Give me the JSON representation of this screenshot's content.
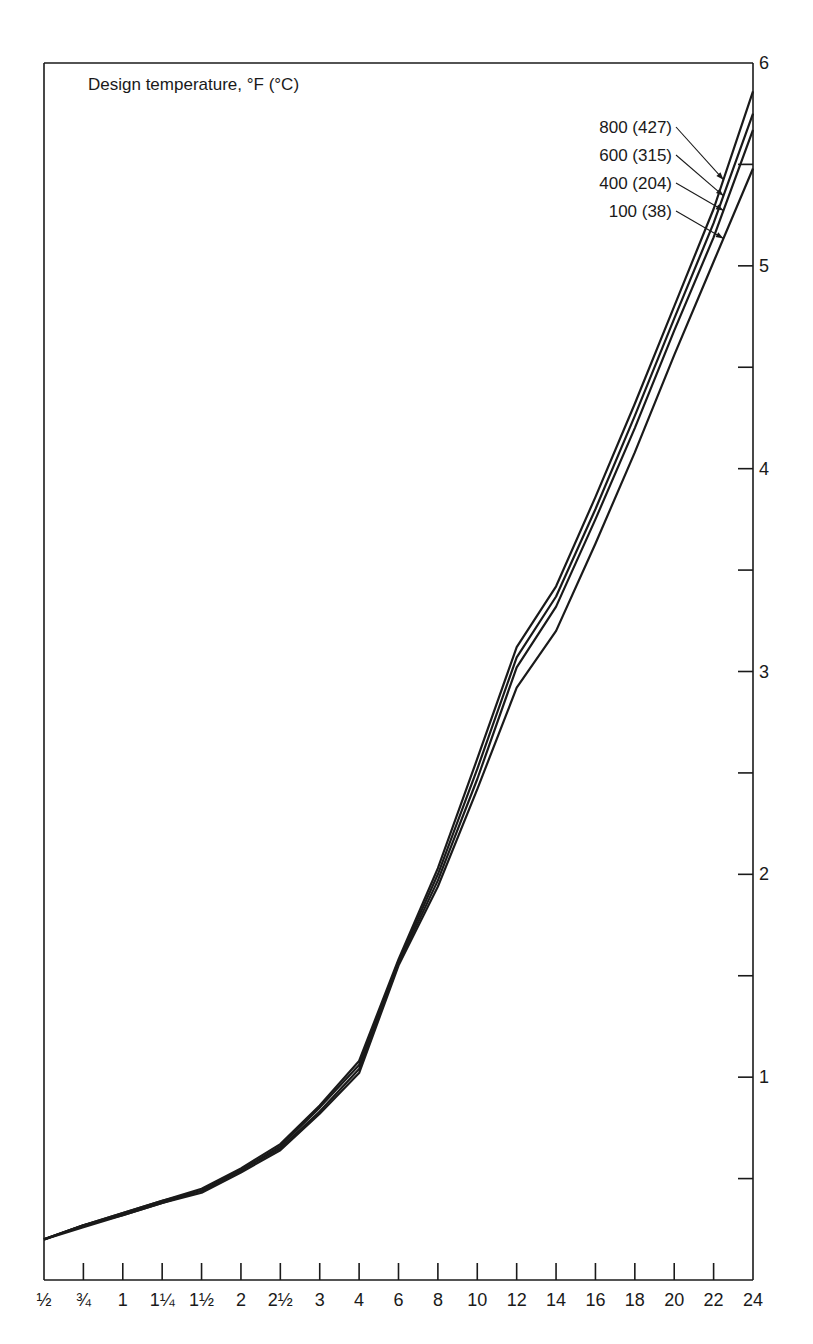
{
  "chart_data": {
    "type": "line",
    "title": "Design temperature, °F (°C)",
    "xlabel": "",
    "ylabel": "",
    "categories": [
      "1/2",
      "3/4",
      "1",
      "1 1/4",
      "1 1/2",
      "2",
      "2 1/2",
      "3",
      "4",
      "6",
      "8",
      "10",
      "12",
      "14",
      "16",
      "18",
      "20",
      "22",
      "24"
    ],
    "x_tick_labels": [
      "½",
      "¾",
      "1",
      "1¼",
      "1½",
      "2",
      "2½",
      "3",
      "4",
      "6",
      "8",
      "10",
      "12",
      "14",
      "16",
      "18",
      "20",
      "22",
      "24"
    ],
    "y_ticks": [
      1,
      2,
      3,
      4,
      5,
      6
    ],
    "y_minor_ticks": [
      0.5,
      1.5,
      2.5,
      3.5,
      4.5,
      5.5
    ],
    "ylim": [
      0,
      6
    ],
    "y_axis_position": "right",
    "grid": false,
    "legend_position": "top-right, leader lines to curves",
    "series": [
      {
        "name": "800 (427)",
        "values": [
          0.2,
          0.27,
          0.33,
          0.39,
          0.45,
          0.55,
          0.67,
          0.86,
          1.08,
          1.58,
          2.03,
          2.57,
          3.12,
          3.42,
          3.86,
          4.32,
          4.8,
          5.28,
          5.86
        ]
      },
      {
        "name": "600 (315)",
        "values": [
          0.2,
          0.27,
          0.33,
          0.39,
          0.44,
          0.54,
          0.66,
          0.85,
          1.06,
          1.57,
          2.0,
          2.52,
          3.07,
          3.37,
          3.8,
          4.26,
          4.74,
          5.21,
          5.75
        ]
      },
      {
        "name": "400 (204)",
        "values": [
          0.2,
          0.27,
          0.32,
          0.38,
          0.44,
          0.54,
          0.65,
          0.83,
          1.04,
          1.56,
          1.97,
          2.47,
          3.02,
          3.32,
          3.75,
          4.2,
          4.68,
          5.14,
          5.67
        ]
      },
      {
        "name": "100 (38)",
        "values": [
          0.2,
          0.26,
          0.32,
          0.38,
          0.43,
          0.53,
          0.64,
          0.82,
          1.02,
          1.55,
          1.94,
          2.42,
          2.92,
          3.2,
          3.63,
          4.08,
          4.56,
          5.02,
          5.48
        ]
      }
    ]
  }
}
